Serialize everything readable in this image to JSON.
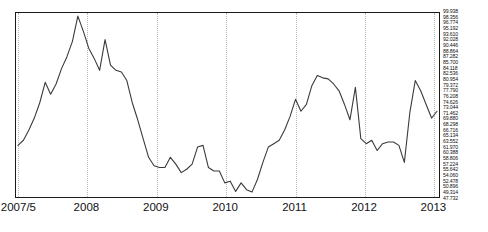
{
  "chart_data": {
    "type": "line",
    "title": "",
    "xlabel": "",
    "ylabel": "",
    "grid": "vertical-dotted",
    "legend": "none",
    "xlim": [
      "2007/5",
      "2013/10"
    ],
    "ylim": [
      47.732,
      99.938
    ],
    "y_tick_step": 1.582,
    "x_tick_labels": [
      "2007/5",
      "2008",
      "2009",
      "2010",
      "2011",
      "2012",
      "2013"
    ],
    "y_tick_labels": [
      "99.938",
      "98.356",
      "96.774",
      "95.192",
      "93.610",
      "92.028",
      "90.446",
      "88.864",
      "87.282",
      "85.700",
      "84.118",
      "82.536",
      "80.954",
      "79.372",
      "77.790",
      "76.208",
      "74.626",
      "73.044",
      "71.462",
      "69.880",
      "68.298",
      "66.716",
      "65.134",
      "63.552",
      "61.970",
      "60.388",
      "58.806",
      "57.224",
      "55.642",
      "54.060",
      "52.478",
      "50.896",
      "49.314",
      "47.732"
    ],
    "series": [
      {
        "name": "series-1",
        "color": "#3b3b3b",
        "x": [
          "2007/5",
          "2007/6",
          "2007/7",
          "2007/8",
          "2007/9",
          "2007/10",
          "2007/11",
          "2007/12",
          "2008/1",
          "2008/2",
          "2008/3",
          "2008/4",
          "2008/5",
          "2008/6",
          "2008/7",
          "2008/8",
          "2008/9",
          "2008/10",
          "2008/11",
          "2008/12",
          "2009/1",
          "2009/2",
          "2009/3",
          "2009/4",
          "2009/5",
          "2009/6",
          "2009/7",
          "2009/8",
          "2009/9",
          "2009/10",
          "2009/11",
          "2009/12",
          "2010/1",
          "2010/2",
          "2010/3",
          "2010/4",
          "2010/5",
          "2010/6",
          "2010/7",
          "2010/8",
          "2010/9",
          "2010/10",
          "2010/11",
          "2010/12",
          "2011/1",
          "2011/2",
          "2011/3",
          "2011/4",
          "2011/5",
          "2011/6",
          "2011/7",
          "2011/8",
          "2011/9",
          "2011/10",
          "2011/11",
          "2011/12",
          "2012/1",
          "2012/2",
          "2012/3",
          "2012/4",
          "2012/5",
          "2012/6",
          "2012/7",
          "2012/8",
          "2012/9",
          "2012/10",
          "2012/11",
          "2012/12",
          "2013/1",
          "2013/2",
          "2013/3",
          "2013/4",
          "2013/5",
          "2013/6",
          "2013/7",
          "2013/8",
          "2013/9",
          "2013/10"
        ],
        "values": [
          62.0,
          63.5,
          66.5,
          70.0,
          74.5,
          80.5,
          77.0,
          80.0,
          84.5,
          88.0,
          92.5,
          99.9,
          95.5,
          90.5,
          87.5,
          84.0,
          93.0,
          85.5,
          84.0,
          83.5,
          81.0,
          74.5,
          69.5,
          64.0,
          58.5,
          56.0,
          55.5,
          55.5,
          58.5,
          56.5,
          54.0,
          55.0,
          56.5,
          61.5,
          62.0,
          55.5,
          54.5,
          54.5,
          51.0,
          51.5,
          48.5,
          51.0,
          49.0,
          48.3,
          52.0,
          57.0,
          61.5,
          62.5,
          63.5,
          66.5,
          70.5,
          75.5,
          72.0,
          74.0,
          79.5,
          82.5,
          81.8,
          81.5,
          80.0,
          78.0,
          74.0,
          69.5,
          79.0,
          64.0,
          62.5,
          63.5,
          60.5,
          62.5,
          63.0,
          63.0,
          62.0,
          57.0,
          71.5,
          81.0,
          78.0,
          74.0,
          70.0,
          72.0
        ]
      }
    ]
  }
}
